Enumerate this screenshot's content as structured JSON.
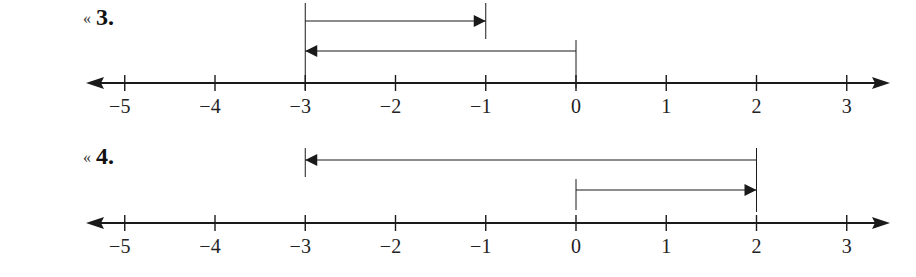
{
  "colors": {
    "ink": "#1a1a1a",
    "background": "#ffffff"
  },
  "axis": {
    "min": -5,
    "max": 3,
    "tick_values": [
      -5,
      -4,
      -3,
      -2,
      -1,
      0,
      1,
      2,
      3
    ],
    "tick_labels": [
      "−5",
      "−4",
      "−3",
      "−2",
      "−1",
      "0",
      "1",
      "2",
      "3"
    ]
  },
  "problems": [
    {
      "marker": "«",
      "number": "3.",
      "arrows": [
        {
          "from": -3,
          "to": -1,
          "direction": "right"
        },
        {
          "from": 0,
          "to": -3,
          "direction": "left"
        }
      ]
    },
    {
      "marker": "«",
      "number": "4.",
      "arrows": [
        {
          "from": 2,
          "to": -3,
          "direction": "left"
        },
        {
          "from": 0,
          "to": 2,
          "direction": "right"
        }
      ]
    }
  ],
  "chart_data": [
    {
      "type": "number-line",
      "title": "3.",
      "xlim": [
        -5,
        3
      ],
      "ticks": [
        -5,
        -4,
        -3,
        -2,
        -1,
        0,
        1,
        2,
        3
      ],
      "vectors": [
        {
          "start": -3,
          "end": -1,
          "length": 2
        },
        {
          "start": 0,
          "end": -3,
          "length": -3
        }
      ]
    },
    {
      "type": "number-line",
      "title": "4.",
      "xlim": [
        -5,
        3
      ],
      "ticks": [
        -5,
        -4,
        -3,
        -2,
        -1,
        0,
        1,
        2,
        3
      ],
      "vectors": [
        {
          "start": 2,
          "end": -3,
          "length": -5
        },
        {
          "start": 0,
          "end": 2,
          "length": 2
        }
      ]
    }
  ]
}
